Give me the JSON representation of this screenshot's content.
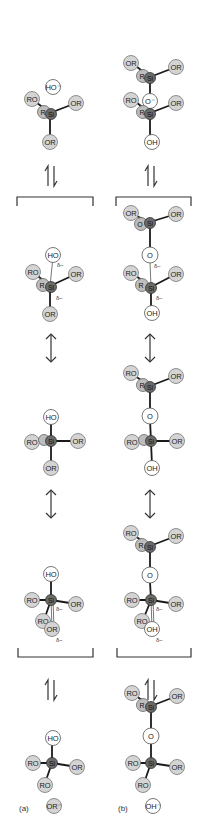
{
  "panel_labels": {
    "a": "(a)",
    "b": "(b)"
  },
  "atom_labels": {
    "OR": "OR",
    "RO": "RO",
    "HO": "HO",
    "OH": "OH",
    "O": "O",
    "O_minus": "O⁻",
    "HO_minus": "HO⁻",
    "OR_minus": "OR⁻",
    "OH_minus": "OH⁻",
    "Si": "Si",
    "R": "R",
    "delta_minus": "δ−"
  },
  "colors": {
    "alkoxy_fill": "#d4d4d4",
    "hydroxy_fill": "#ffffff",
    "silicon_fill": "#6b6b6b",
    "bond": "#1a1a1a"
  },
  "stages": [
    "reactants",
    "transition_state_1",
    "pentacoordinate_intermediate",
    "transition_state_2",
    "products"
  ],
  "arrows": {
    "equilibrium": "⇌",
    "resonance": "↕"
  }
}
